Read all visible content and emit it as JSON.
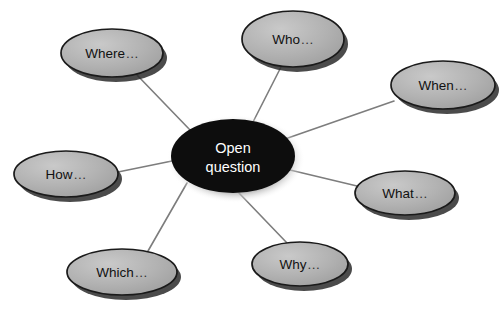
{
  "diagram": {
    "type": "mind-map",
    "background_color": "#ffffff",
    "center": {
      "id": "open-question",
      "label_line1": "Open",
      "label_line2": "question",
      "text_color": "#ffffff",
      "fill_color": "#0d0d0d",
      "cx": 233,
      "cy": 156,
      "rx": 62,
      "ry": 37
    },
    "node_style": {
      "fill_color": "#b2b2b2",
      "stroke_color": "#1a1a1a",
      "shadow_color": "#2b2b2b",
      "text_color": "#111111"
    },
    "connector_style": {
      "color": "#7d7d7d",
      "width": 1.6
    },
    "ellipsis": "...",
    "nodes": [
      {
        "id": "who",
        "label": "Who",
        "cx": 293,
        "cy": 39,
        "rx": 51,
        "ry": 28
      },
      {
        "id": "where",
        "label": "Where",
        "cx": 112,
        "cy": 53,
        "rx": 51,
        "ry": 24
      },
      {
        "id": "when",
        "label": "When",
        "cx": 443,
        "cy": 85,
        "rx": 52,
        "ry": 24
      },
      {
        "id": "what",
        "label": "What",
        "cx": 405,
        "cy": 193,
        "rx": 50,
        "ry": 22
      },
      {
        "id": "how",
        "label": "How",
        "cx": 66,
        "cy": 174,
        "rx": 52,
        "ry": 23
      },
      {
        "id": "which",
        "label": "Which",
        "cx": 122,
        "cy": 272,
        "rx": 55,
        "ry": 23
      },
      {
        "id": "why",
        "label": "Why",
        "cx": 300,
        "cy": 264,
        "rx": 48,
        "ry": 22
      }
    ],
    "connectors": [
      {
        "from": "open-question",
        "to": "who",
        "x1": 252,
        "y1": 124,
        "x2": 281,
        "y2": 67
      },
      {
        "from": "open-question",
        "to": "where",
        "x1": 191,
        "y1": 131,
        "x2": 137,
        "y2": 75
      },
      {
        "from": "open-question",
        "to": "when",
        "x1": 285,
        "y1": 139,
        "x2": 394,
        "y2": 101
      },
      {
        "from": "open-question",
        "to": "what",
        "x1": 290,
        "y1": 170,
        "x2": 357,
        "y2": 186
      },
      {
        "from": "open-question",
        "to": "how",
        "x1": 172,
        "y1": 161,
        "x2": 118,
        "y2": 172
      },
      {
        "from": "open-question",
        "to": "which",
        "x1": 187,
        "y1": 183,
        "x2": 148,
        "y2": 251
      },
      {
        "from": "open-question",
        "to": "why",
        "x1": 239,
        "y1": 193,
        "x2": 287,
        "y2": 243
      }
    ]
  }
}
